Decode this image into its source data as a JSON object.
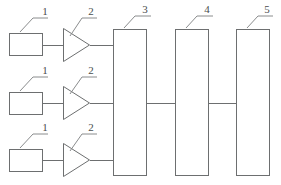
{
  "diagram": {
    "background_color": "#ffffff",
    "line_color": "#6d6f70",
    "label_color": "#4a4c4d",
    "channels": [
      {
        "row": "top",
        "sensor": {
          "label": "1",
          "shape": "rectangle"
        },
        "amplifier": {
          "label": "2",
          "shape": "triangle"
        }
      },
      {
        "row": "middle",
        "sensor": {
          "label": "1",
          "shape": "rectangle"
        },
        "amplifier": {
          "label": "2",
          "shape": "triangle"
        }
      },
      {
        "row": "bottom",
        "sensor": {
          "label": "1",
          "shape": "rectangle"
        },
        "amplifier": {
          "label": "2",
          "shape": "triangle"
        }
      }
    ],
    "units": [
      {
        "label": "3",
        "shape": "tall-rectangle"
      },
      {
        "label": "4",
        "shape": "tall-rectangle"
      },
      {
        "label": "5",
        "shape": "tall-rectangle"
      }
    ],
    "labels": {
      "sensor_top": "1",
      "sensor_middle": "1",
      "sensor_bottom": "1",
      "amp_top": "2",
      "amp_middle": "2",
      "amp_bottom": "2",
      "unit_3": "3",
      "unit_4": "4",
      "unit_5": "5"
    }
  }
}
